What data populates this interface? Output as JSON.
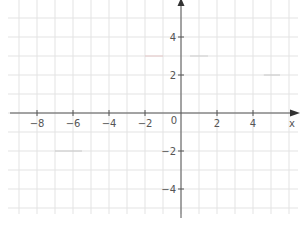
{
  "chart_data": {
    "type": "line",
    "title": "",
    "xlabel": "x",
    "ylabel": "y",
    "xlim": [
      -9.5,
      6.3
    ],
    "ylim": [
      -5.5,
      6
    ],
    "grid": true,
    "x_ticks": [
      -8,
      -6,
      -4,
      -2,
      2,
      4
    ],
    "x_tick_labels": [
      "−8",
      "−6",
      "−4",
      "−2",
      "2",
      "4"
    ],
    "y_ticks": [
      4,
      2,
      -2,
      -4
    ],
    "y_tick_labels": [
      "4",
      "2",
      "−2",
      "−4"
    ],
    "origin_label": "0",
    "series": [
      {
        "name": "segment-a",
        "x": [
          -2.0,
          -1.0
        ],
        "y": [
          3,
          3
        ],
        "color": "#e6c8c8"
      },
      {
        "name": "segment-b",
        "x": [
          0.5,
          1.5
        ],
        "y": [
          3,
          3
        ],
        "color": "#cfcfcf"
      },
      {
        "name": "segment-c",
        "x": [
          4.6,
          5.5
        ],
        "y": [
          2,
          2
        ],
        "color": "#c8c8c8"
      },
      {
        "name": "segment-d",
        "x": [
          -7.0,
          -5.5
        ],
        "y": [
          -2,
          -2
        ],
        "color": "#c8c8c8"
      }
    ]
  },
  "axis": {
    "x_label": "x",
    "y_label": "y",
    "origin": "0"
  },
  "colors": {
    "grid": "#e3e3e3",
    "axis": "#555555",
    "label": "#555555"
  }
}
